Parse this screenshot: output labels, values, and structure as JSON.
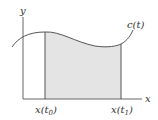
{
  "diagram": {
    "axes": {
      "x_label": "x",
      "y_label": "y"
    },
    "curve_label": "c(t)",
    "bounds": {
      "left": {
        "base": "x(t",
        "sub": "0",
        "close": ")"
      },
      "right": {
        "base": "x(t",
        "sub": "1",
        "close": ")"
      }
    },
    "colors": {
      "fill": "#e4e4e4",
      "line": "#555555",
      "axis": "#666666"
    }
  }
}
